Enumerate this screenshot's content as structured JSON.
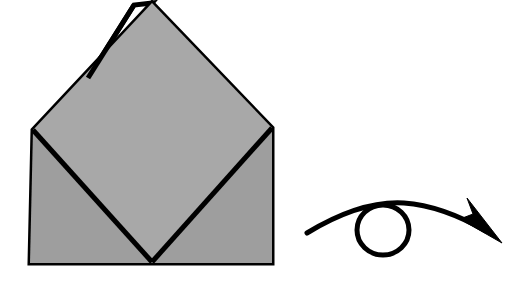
{
  "figure": {
    "background_color": "#ffffff",
    "width": 524,
    "height": 290
  },
  "colors": {
    "paper_fill": "#a8a8a8",
    "paper_fill_shadow": "#9e9e9e",
    "outline": "#000000",
    "flap_fill": "#ffffff",
    "background": "#ffffff",
    "arrow": "#000000"
  },
  "model": {
    "label": "folded-paper-model",
    "description": "Square base with an upper diamond flap, seen from the front",
    "outline_width": 5,
    "body_points": "152,3 272,128 272,263 30,263 33,130",
    "diamond_points": "152,3 272,128 152,262 33,130",
    "left_diagonal": "33,130 152,262",
    "right_diagonal": "272,128 152,262",
    "base_square_points": "33,130 272,128 272,263 30,263",
    "hidden_flap_points": "134,5 88,78 152,3",
    "hidden_flap_edge": "134,5 88,78",
    "vertices": {
      "apex": [
        152,
        3
      ],
      "flap_peak": [
        134,
        5
      ],
      "flap_merge": [
        88,
        78
      ],
      "left_corner": [
        33,
        130
      ],
      "right_corner": [
        272,
        128
      ],
      "bottom_left": [
        30,
        263
      ],
      "bottom_right": [
        272,
        263
      ],
      "bottom_center": [
        152,
        262
      ]
    }
  },
  "turn_over_symbol": {
    "label": "turn-over-arrow",
    "meaning": "Turn the model over",
    "stroke_width": 5,
    "curve_path": "M 307,233 C 340,213 372,201 404,203 C 432,205 460,216 486,231",
    "loop": {
      "center_x": 383,
      "center_y": 230,
      "radius_x": 26,
      "radius_y": 25
    },
    "arrow_head_points": "502,243 460,219 473,214 467,198"
  },
  "accessibility": {
    "alt_text": "Origami diagram showing a gray folded paper shape with a diamond fold on top of a square base, and a looping arrow indicating the model should be turned over."
  }
}
